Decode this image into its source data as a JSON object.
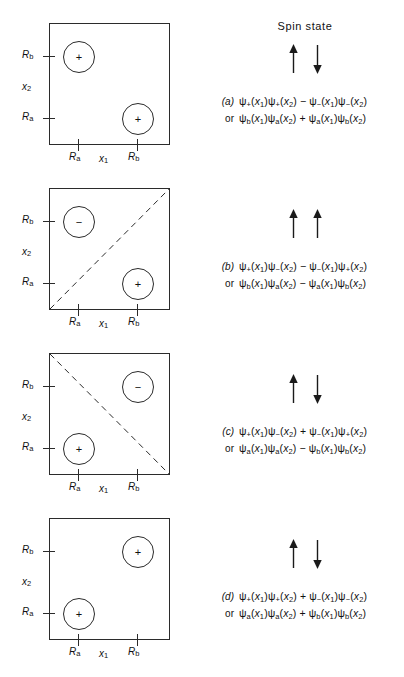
{
  "figure": {
    "spin_state_title": "Spin state",
    "axis": {
      "x_label": "x1",
      "y_label": "x2",
      "tick_a": "Ra",
      "tick_b": "Rb"
    },
    "panels": [
      {
        "id": "a",
        "label": "(a)",
        "or_label": "or",
        "spin": [
          "up",
          "down"
        ],
        "spin_text": "up down",
        "diagonal": "none",
        "blobs": [
          {
            "x": "Ra",
            "y": "Rb",
            "sign": "+"
          },
          {
            "x": "Rb",
            "y": "Ra",
            "sign": "+"
          }
        ],
        "equation_1": "ψ+(x1)ψ+(x2) − ψ−(x1)ψ−(x2)",
        "equation_2": "ψb(x1)ψa(x2) + ψa(x1)ψb(x2)",
        "eq1_terms": [
          {
            "psi": "ψ",
            "sub": "+",
            "arg": "x",
            "argsub": "1"
          },
          {
            "psi": "ψ",
            "sub": "+",
            "arg": "x",
            "argsub": "2"
          },
          {
            "op": "−"
          },
          {
            "psi": "ψ",
            "sub": "−",
            "arg": "x",
            "argsub": "1"
          },
          {
            "psi": "ψ",
            "sub": "−",
            "arg": "x",
            "argsub": "2"
          }
        ],
        "eq2_terms": [
          {
            "psi": "ψ",
            "sub": "b",
            "arg": "x",
            "argsub": "1"
          },
          {
            "psi": "ψ",
            "sub": "a",
            "arg": "x",
            "argsub": "2"
          },
          {
            "op": "+"
          },
          {
            "psi": "ψ",
            "sub": "a",
            "arg": "x",
            "argsub": "1"
          },
          {
            "psi": "ψ",
            "sub": "b",
            "arg": "x",
            "argsub": "2"
          }
        ]
      },
      {
        "id": "b",
        "label": "(b)",
        "or_label": "or",
        "spin": [
          "up",
          "up"
        ],
        "spin_text": "up up",
        "diagonal": "rising",
        "blobs": [
          {
            "x": "Ra",
            "y": "Rb",
            "sign": "−"
          },
          {
            "x": "Rb",
            "y": "Ra",
            "sign": "+"
          }
        ],
        "equation_1": "ψ+(x1)ψ−(x2) − ψ−(x1)ψ+(x2)",
        "equation_2": "ψb(x1)ψa(x2) − ψa(x1)ψb(x2)",
        "eq1_terms": [
          {
            "psi": "ψ",
            "sub": "+",
            "arg": "x",
            "argsub": "1"
          },
          {
            "psi": "ψ",
            "sub": "−",
            "arg": "x",
            "argsub": "2"
          },
          {
            "op": "−"
          },
          {
            "psi": "ψ",
            "sub": "−",
            "arg": "x",
            "argsub": "1"
          },
          {
            "psi": "ψ",
            "sub": "+",
            "arg": "x",
            "argsub": "2"
          }
        ],
        "eq2_terms": [
          {
            "psi": "ψ",
            "sub": "b",
            "arg": "x",
            "argsub": "1"
          },
          {
            "psi": "ψ",
            "sub": "a",
            "arg": "x",
            "argsub": "2"
          },
          {
            "op": "−"
          },
          {
            "psi": "ψ",
            "sub": "a",
            "arg": "x",
            "argsub": "1"
          },
          {
            "psi": "ψ",
            "sub": "b",
            "arg": "x",
            "argsub": "2"
          }
        ]
      },
      {
        "id": "c",
        "label": "(c)",
        "or_label": "or",
        "spin": [
          "up",
          "down"
        ],
        "spin_text": "up down",
        "diagonal": "falling",
        "blobs": [
          {
            "x": "Rb",
            "y": "Rb",
            "sign": "−"
          },
          {
            "x": "Ra",
            "y": "Ra",
            "sign": "+"
          }
        ],
        "equation_1": "ψ+(x1)ψ−(x2) + ψ−(x1)ψ+(x2)",
        "equation_2": "ψa(x1)ψa(x2) − ψb(x1)ψb(x2)",
        "eq1_terms": [
          {
            "psi": "ψ",
            "sub": "+",
            "arg": "x",
            "argsub": "1"
          },
          {
            "psi": "ψ",
            "sub": "−",
            "arg": "x",
            "argsub": "2"
          },
          {
            "op": "+"
          },
          {
            "psi": "ψ",
            "sub": "−",
            "arg": "x",
            "argsub": "1"
          },
          {
            "psi": "ψ",
            "sub": "+",
            "arg": "x",
            "argsub": "2"
          }
        ],
        "eq2_terms": [
          {
            "psi": "ψ",
            "sub": "a",
            "arg": "x",
            "argsub": "1"
          },
          {
            "psi": "ψ",
            "sub": "a",
            "arg": "x",
            "argsub": "2"
          },
          {
            "op": "−"
          },
          {
            "psi": "ψ",
            "sub": "b",
            "arg": "x",
            "argsub": "1"
          },
          {
            "psi": "ψ",
            "sub": "b",
            "arg": "x",
            "argsub": "2"
          }
        ]
      },
      {
        "id": "d",
        "label": "(d)",
        "or_label": "or",
        "spin": [
          "up",
          "down"
        ],
        "spin_text": "up down",
        "diagonal": "none",
        "blobs": [
          {
            "x": "Rb",
            "y": "Rb",
            "sign": "+"
          },
          {
            "x": "Ra",
            "y": "Ra",
            "sign": "+"
          }
        ],
        "equation_1": "ψ+(x1)ψ+(x2) + ψ−(x1)ψ−(x2)",
        "equation_2": "ψa(x1)ψa(x2) + ψb(x1)ψb(x2)",
        "eq1_terms": [
          {
            "psi": "ψ",
            "sub": "+",
            "arg": "x",
            "argsub": "1"
          },
          {
            "psi": "ψ",
            "sub": "+",
            "arg": "x",
            "argsub": "2"
          },
          {
            "op": "+"
          },
          {
            "psi": "ψ",
            "sub": "−",
            "arg": "x",
            "argsub": "1"
          },
          {
            "psi": "ψ",
            "sub": "−",
            "arg": "x",
            "argsub": "2"
          }
        ],
        "eq2_terms": [
          {
            "psi": "ψ",
            "sub": "a",
            "arg": "x",
            "argsub": "1"
          },
          {
            "psi": "ψ",
            "sub": "a",
            "arg": "x",
            "argsub": "2"
          },
          {
            "op": "+"
          },
          {
            "psi": "ψ",
            "sub": "b",
            "arg": "x",
            "argsub": "1"
          },
          {
            "psi": "ψ",
            "sub": "b",
            "arg": "x",
            "argsub": "2"
          }
        ]
      }
    ],
    "colors": {
      "ink": "#2b2b2b",
      "background": "#ffffff"
    }
  }
}
